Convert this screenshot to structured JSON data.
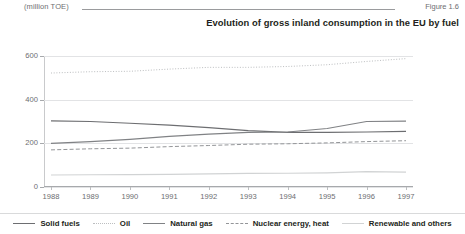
{
  "header": {
    "unit_label": "(million TOE)",
    "figure_label": "Figure 1.6"
  },
  "title": "Evolution of gross inland consumption in the EU by fuel",
  "colors": {
    "solid_fuels": "#6d6e71",
    "oil": "#bcbec0",
    "natural_gas": "#808285",
    "nuclear": "#939598",
    "renewable": "#d1d3d4",
    "axis": "#a7a9ac",
    "grid": "#e2e3e5",
    "text": "#231f20",
    "muted_text": "#6d6e71"
  },
  "chart_data": {
    "type": "line",
    "title": "Evolution of gross inland consumption in the EU by fuel",
    "xlabel": "",
    "ylabel": "(million TOE)",
    "ylim": [
      0,
      600
    ],
    "yticks": [
      0,
      200,
      400,
      600
    ],
    "grid": true,
    "legend_position": "bottom",
    "categories": [
      "1988",
      "1989",
      "1990",
      "1991",
      "1992",
      "1993",
      "1994",
      "1995",
      "1996",
      "1997"
    ],
    "series": [
      {
        "name": "Solid fuels",
        "style": "solid",
        "color": "#6d6e71",
        "values": [
          303,
          300,
          292,
          283,
          272,
          258,
          250,
          250,
          252,
          255
        ]
      },
      {
        "name": "Oil",
        "style": "dotted",
        "color": "#bcbec0",
        "values": [
          522,
          528,
          530,
          540,
          548,
          548,
          552,
          560,
          575,
          588
        ]
      },
      {
        "name": "Natural gas",
        "style": "solid",
        "color": "#808285",
        "values": [
          200,
          208,
          218,
          232,
          242,
          250,
          252,
          268,
          300,
          302
        ]
      },
      {
        "name": "Nuclear energy, heat",
        "style": "dashed",
        "color": "#939598",
        "values": [
          170,
          175,
          178,
          185,
          190,
          196,
          198,
          202,
          208,
          212
        ]
      },
      {
        "name": "Renewable and others",
        "style": "solid",
        "color": "#d1d3d4",
        "values": [
          55,
          56,
          57,
          58,
          60,
          62,
          63,
          65,
          70,
          68
        ]
      }
    ]
  }
}
